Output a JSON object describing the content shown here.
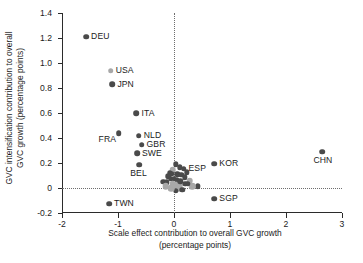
{
  "chart_data": {
    "type": "scatter",
    "title": "",
    "xlabel": "Scale effect contribution to overall GVC growth (percentage points)",
    "xlabel_line1": "Scale effect contribution to overall GVC growth",
    "xlabel_line2": "(percentage points)",
    "ylabel": "GVC intensification contribution to overall GVC growth (percentage points)",
    "ylabel_line1": "GVC intensification contribution to overall",
    "ylabel_line2": "GVC growth (percentage points)",
    "xlim": [
      -2,
      3
    ],
    "ylim": [
      -0.2,
      1.4
    ],
    "xticks": [
      "-2",
      "-1",
      "0",
      "1",
      "2",
      "3"
    ],
    "xtick_values": [
      -2,
      -1,
      0,
      1,
      2,
      3
    ],
    "yticks": [
      "-0.2",
      "0",
      "0.2",
      "0.4",
      "0.6",
      "0.8",
      "1.0",
      "1.2",
      "1.4"
    ],
    "ytick_values": [
      -0.2,
      0,
      0.2,
      0.4,
      0.6,
      0.8,
      1.0,
      1.2,
      1.4
    ],
    "grid": false,
    "reference_lines": {
      "vertical_x": 0,
      "horizontal_y": 0,
      "style": "dotted"
    },
    "legend": "none",
    "colors": {
      "dark_marker": "#4a4a4a",
      "light_marker": "#a8a8a8",
      "axis": "#2b2b2b",
      "text": "#1b1b1b"
    },
    "labeled_points": [
      {
        "label": "DEU",
        "x": -1.57,
        "y": 1.21,
        "shade": "dark",
        "label_side": "right"
      },
      {
        "label": "USA",
        "x": -1.13,
        "y": 0.94,
        "shade": "light",
        "label_side": "right"
      },
      {
        "label": "JPN",
        "x": -1.1,
        "y": 0.83,
        "shade": "dark",
        "label_side": "right"
      },
      {
        "label": "ITA",
        "x": -0.67,
        "y": 0.6,
        "shade": "dark",
        "label_side": "right"
      },
      {
        "label": "NLD",
        "x": -0.63,
        "y": 0.42,
        "shade": "dark",
        "label_side": "right"
      },
      {
        "label": "FRA",
        "x": -0.99,
        "y": 0.44,
        "shade": "dark",
        "label_side": "below-left"
      },
      {
        "label": "GBR",
        "x": -0.58,
        "y": 0.345,
        "shade": "dark",
        "label_side": "right"
      },
      {
        "label": "SWE",
        "x": -0.66,
        "y": 0.28,
        "shade": "dark",
        "label_side": "right"
      },
      {
        "label": "BEL",
        "x": -0.62,
        "y": 0.185,
        "shade": "dark",
        "label_side": "below"
      },
      {
        "label": "ESP",
        "x": 0.17,
        "y": 0.155,
        "shade": "dark",
        "label_side": "right"
      },
      {
        "label": "KOR",
        "x": 0.72,
        "y": 0.195,
        "shade": "dark",
        "label_side": "right"
      },
      {
        "label": "CHN",
        "x": 2.65,
        "y": 0.29,
        "shade": "dark",
        "label_side": "below"
      },
      {
        "label": "TWN",
        "x": -1.16,
        "y": -0.125,
        "shade": "dark",
        "label_side": "right"
      },
      {
        "label": "SGP",
        "x": 0.72,
        "y": -0.085,
        "shade": "dark",
        "label_side": "right"
      }
    ],
    "unlabeled_points": [
      {
        "x": 0.03,
        "y": 0.19,
        "shade": "dark"
      },
      {
        "x": 0.1,
        "y": 0.165,
        "shade": "dark"
      },
      {
        "x": -0.02,
        "y": 0.145,
        "shade": "light"
      },
      {
        "x": 0.23,
        "y": 0.125,
        "shade": "dark"
      },
      {
        "x": -0.08,
        "y": 0.12,
        "shade": "dark"
      },
      {
        "x": -0.04,
        "y": 0.115,
        "shade": "dark"
      },
      {
        "x": 0.06,
        "y": 0.11,
        "shade": "dark"
      },
      {
        "x": 0.13,
        "y": 0.105,
        "shade": "dark"
      },
      {
        "x": 0.19,
        "y": 0.085,
        "shade": "dark"
      },
      {
        "x": -0.1,
        "y": 0.095,
        "shade": "dark"
      },
      {
        "x": -0.06,
        "y": 0.075,
        "shade": "dark"
      },
      {
        "x": 0.0,
        "y": 0.075,
        "shade": "dark"
      },
      {
        "x": 0.05,
        "y": 0.065,
        "shade": "dark"
      },
      {
        "x": 0.28,
        "y": 0.06,
        "shade": "light"
      },
      {
        "x": -0.19,
        "y": 0.05,
        "shade": "dark"
      },
      {
        "x": -0.13,
        "y": 0.045,
        "shade": "dark"
      },
      {
        "x": -0.02,
        "y": 0.03,
        "shade": "light"
      },
      {
        "x": 0.04,
        "y": 0.025,
        "shade": "light"
      },
      {
        "x": 0.09,
        "y": 0.02,
        "shade": "light"
      },
      {
        "x": 0.43,
        "y": 0.015,
        "shade": "dark"
      },
      {
        "x": 0.33,
        "y": 0.015,
        "shade": "light"
      },
      {
        "x": 0.01,
        "y": 0.005,
        "shade": "light"
      },
      {
        "x": 0.07,
        "y": 0.0,
        "shade": "light"
      },
      {
        "x": 0.15,
        "y": -0.015,
        "shade": "dark"
      },
      {
        "x": 0.03,
        "y": -0.02,
        "shade": "dark"
      },
      {
        "x": -0.05,
        "y": 0.0,
        "shade": "light"
      },
      {
        "x": 0.2,
        "y": 0.035,
        "shade": "dark"
      },
      {
        "x": 0.25,
        "y": 0.035,
        "shade": "dark"
      },
      {
        "x": 0.11,
        "y": 0.055,
        "shade": "dark"
      },
      {
        "x": -0.15,
        "y": 0.015,
        "shade": "light"
      }
    ]
  }
}
